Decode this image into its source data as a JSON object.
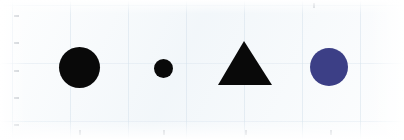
{
  "scene": {
    "width": 404,
    "height": 140,
    "background_color": "#f3f7fa",
    "paper_color": "#ffffff",
    "description": "Four geometric shapes on a pale scanned-paper background"
  },
  "palette": {
    "black": "#090909",
    "indigo": "#3c3f86",
    "background": "#f3f7fa",
    "tick": "#9aa3ab"
  },
  "shapes": [
    {
      "name": "large-black-circle",
      "kind": "circle",
      "color": "#090909",
      "center_x": 79.5,
      "center_y": 67.5,
      "diameter": 41,
      "size_label": "large"
    },
    {
      "name": "small-black-circle",
      "kind": "circle",
      "color": "#090909",
      "center_x": 163,
      "center_y": 68,
      "diameter": 19,
      "size_label": "small"
    },
    {
      "name": "black-triangle",
      "kind": "triangle",
      "color": "#090909",
      "center_x": 245,
      "apex_x": 244,
      "apex_y": 41,
      "base_left_x": 218,
      "base_right_x": 272,
      "base_y": 85,
      "width": 54,
      "height": 44,
      "size_label": "large"
    },
    {
      "name": "indigo-circle",
      "kind": "circle",
      "color": "#3c3f86",
      "center_x": 329,
      "center_y": 67,
      "diameter": 38,
      "size_label": "medium"
    }
  ],
  "ticks": {
    "left": [
      {
        "x": 14,
        "y": 15
      },
      {
        "x": 14,
        "y": 42
      },
      {
        "x": 14,
        "y": 70
      },
      {
        "x": 14,
        "y": 97
      },
      {
        "x": 14,
        "y": 124
      }
    ],
    "bottom": [
      {
        "x": 79,
        "y": 130
      },
      {
        "x": 163,
        "y": 130
      },
      {
        "x": 245,
        "y": 130
      },
      {
        "x": 330,
        "y": 130
      }
    ],
    "top": [
      {
        "x": 313,
        "y": 3
      }
    ]
  }
}
